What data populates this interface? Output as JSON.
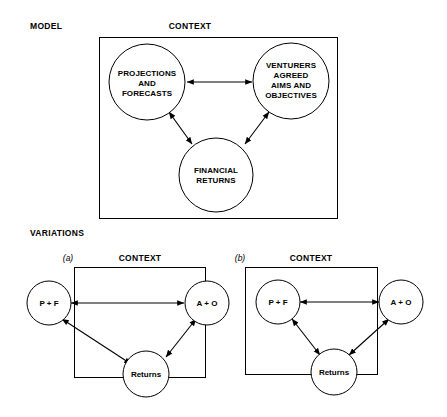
{
  "figure": {
    "title_labels": {
      "model": "MODEL",
      "variations": "VARIATIONS"
    },
    "model": {
      "context_label": "CONTEXT",
      "nodes": [
        {
          "id": "projections",
          "lines": [
            "PROJECTIONS",
            "AND",
            "FORECASTS"
          ],
          "cx": 147,
          "cy": 82,
          "r": 38
        },
        {
          "id": "venturers",
          "lines": [
            "VENTURERS",
            "AGREED",
            "AIMS AND",
            "OBJECTIVES"
          ],
          "cx": 291,
          "cy": 81,
          "r": 38
        },
        {
          "id": "financial-returns",
          "lines": [
            "FINANCIAL",
            "RETURNS"
          ],
          "cx": 216,
          "cy": 175,
          "r": 37
        }
      ],
      "edges": [
        {
          "from": "projections",
          "to": "venturers",
          "type": "double"
        },
        {
          "from": "projections",
          "to": "financial-returns",
          "type": "double"
        },
        {
          "from": "venturers",
          "to": "financial-returns",
          "type": "double"
        }
      ]
    },
    "variations": [
      {
        "tag": "(a)",
        "context_label": "CONTEXT",
        "nodes": [
          {
            "id": "pf",
            "label": "P + F"
          },
          {
            "id": "ao",
            "label": "A + O"
          },
          {
            "id": "returns",
            "label": "Returns"
          }
        ],
        "edges": [
          {
            "from": "pf",
            "to": "ao",
            "type": "double"
          },
          {
            "from": "pf",
            "to": "returns",
            "type": "double"
          },
          {
            "from": "ao",
            "to": "returns",
            "type": "double"
          }
        ],
        "note": "P + F and A + O sit outside the context box"
      },
      {
        "tag": "(b)",
        "context_label": "CONTEXT",
        "nodes": [
          {
            "id": "pf",
            "label": "P + F"
          },
          {
            "id": "ao",
            "label": "A + O"
          },
          {
            "id": "returns",
            "label": "Returns"
          }
        ],
        "edges": [
          {
            "from": "pf",
            "to": "ao",
            "type": "double"
          },
          {
            "from": "pf",
            "to": "returns",
            "type": "double"
          },
          {
            "from": "ao",
            "to": "returns",
            "type": "double"
          }
        ],
        "note": "P + F sits inside the context box; A + O straddles the right edge"
      }
    ],
    "colors": {
      "stroke": "#000000",
      "fill": "#ffffff",
      "background": "#ffffff"
    }
  }
}
